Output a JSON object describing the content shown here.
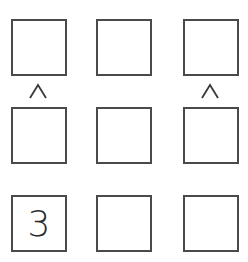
{
  "puzzle": {
    "type": "futoshiki",
    "rows": 3,
    "cols": 3,
    "grid": [
      [
        "",
        "",
        ""
      ],
      [
        "",
        "",
        ""
      ],
      [
        "3",
        "",
        ""
      ]
    ],
    "constraints": [
      {
        "between": "r1c1-r2c1",
        "symbol": "^",
        "meaning": "top < bottom"
      },
      {
        "between": "r1c3-r2c3",
        "symbol": "^",
        "meaning": "top < bottom"
      }
    ]
  },
  "colors": {
    "border": "#4a4a4a",
    "text": "#2a2a2a",
    "background": "#ffffff"
  }
}
